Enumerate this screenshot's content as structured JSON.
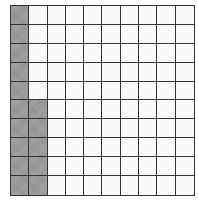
{
  "figure": {
    "type": "hundred-grid",
    "rows": 10,
    "columns": 10,
    "total_cells": 100,
    "shaded_count": 15,
    "shaded_cells": {
      "column_1": [
        1,
        2,
        3,
        4,
        5,
        6,
        7,
        8,
        9,
        10
      ],
      "column_2": [
        6,
        7,
        8,
        9,
        10
      ]
    },
    "colors": {
      "shaded": "#9a9a9a",
      "unshaded": "#fafafa",
      "lines": "#333333"
    }
  }
}
